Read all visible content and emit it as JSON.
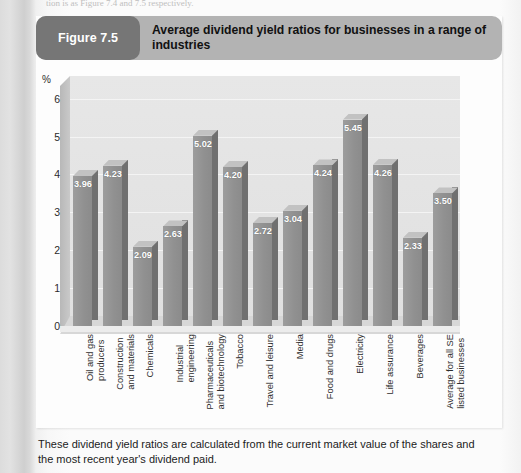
{
  "page": {
    "top_cropped_line": "tion is as Figure 7.4 and 7.5 respectively."
  },
  "figure": {
    "tag": "Figure 7.5",
    "title": "Average dividend yield ratios for businesses in a range of industries",
    "caption": "These dividend yield ratios are calculated from the current market value of the shares and the most recent year's dividend paid."
  },
  "colors": {
    "header_bar": "#b3b3b3",
    "tag_pill": "#767676",
    "bar_front": "#919191",
    "bar_side": "#707070",
    "plot_background": "#e4e4e4",
    "card_background": "#fdfdfd"
  },
  "chart_data": {
    "type": "bar",
    "title": "Average dividend yield ratios for businesses in a range of industries",
    "xlabel": "",
    "ylabel": "%",
    "ylim": [
      0,
      6.6
    ],
    "yticks": [
      0,
      1,
      2,
      3,
      4,
      5,
      6
    ],
    "ytick_labels": [
      "0",
      "1",
      "2",
      "3",
      "4",
      "5",
      "6"
    ],
    "grid": true,
    "legend": "none",
    "value_labels": true,
    "style": "3d-column",
    "categories": [
      "Oil and gas producers",
      "Construction and materials",
      "Chemicals",
      "Industrial engineering",
      "Pharmaceuticals and biotechnology",
      "Tobacco",
      "Travel and leisure",
      "Media",
      "Food and drugs",
      "Electricity",
      "Life assurance",
      "Beverages",
      "Average for all SE listed businesses"
    ],
    "category_lines": [
      [
        "Oil and gas",
        "producers"
      ],
      [
        "Construction",
        "and materials"
      ],
      [
        "Chemicals"
      ],
      [
        "Industrial",
        "engineering"
      ],
      [
        "Pharmaceuticals",
        "and biotechnology"
      ],
      [
        "Tobacco"
      ],
      [
        "Travel and leisure"
      ],
      [
        "Media"
      ],
      [
        "Food and drugs"
      ],
      [
        "Electricity"
      ],
      [
        "Life assurance"
      ],
      [
        "Beverages"
      ],
      [
        "Average for all SE",
        "listed businesses"
      ]
    ],
    "values": [
      3.96,
      4.23,
      2.09,
      2.63,
      5.02,
      4.2,
      2.72,
      3.04,
      4.24,
      5.45,
      4.26,
      2.33,
      3.5
    ],
    "value_text": [
      "3.96",
      "4.23",
      "2.09",
      "2.63",
      "5.02",
      "4.20",
      "2.72",
      "3.04",
      "4.24",
      "5.45",
      "4.26",
      "2.33",
      "3.50"
    ]
  }
}
